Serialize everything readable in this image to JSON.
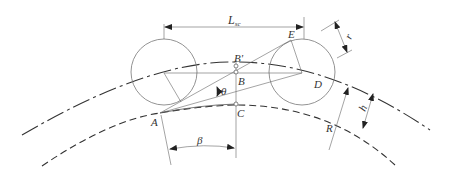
{
  "diagram": {
    "title": "",
    "labels": {
      "L_sc_main": "L",
      "L_sc_sub": "sc",
      "E": "E",
      "B_prime": "B'",
      "B": "B",
      "D": "D",
      "theta": "θ",
      "A": "A",
      "C": "C",
      "beta": "β",
      "R": "R",
      "h": "h",
      "r": "r"
    },
    "elements": [
      {
        "type": "arc",
        "name": "outer-track-arc",
        "style": "dash-dot"
      },
      {
        "type": "arc",
        "name": "inner-track-arc",
        "style": "dashed"
      },
      {
        "type": "circle",
        "name": "left-wheel"
      },
      {
        "type": "circle",
        "name": "right-wheel"
      },
      {
        "type": "dimension",
        "name": "wheelbase-Lsc"
      },
      {
        "type": "dimension",
        "name": "wheel-radius-r"
      },
      {
        "type": "dimension",
        "name": "height-h"
      },
      {
        "type": "dimension",
        "name": "radius-R"
      },
      {
        "type": "angle",
        "name": "angle-theta"
      },
      {
        "type": "angle",
        "name": "angle-beta"
      }
    ],
    "colors": {
      "stroke": "#333333",
      "background": "#ffffff"
    }
  }
}
